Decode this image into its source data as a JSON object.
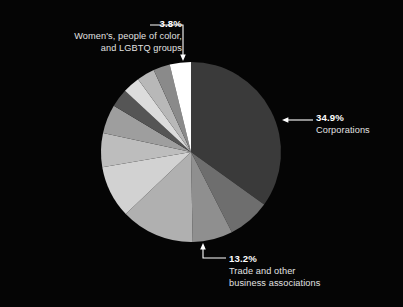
{
  "background": "#050505",
  "chart_data": {
    "type": "pie",
    "title": "",
    "subtitle": "",
    "xlabel": "",
    "ylabel": "",
    "legend_position": "callout-annotations",
    "grid": false,
    "center": {
      "x": 191,
      "y": 152
    },
    "radius": 90,
    "start_angle_deg": 0,
    "direction": "clockwise",
    "categories": [
      "Corporations",
      "Segment 2",
      "Segment 3",
      "Trade and other business associations",
      "Segment 5",
      "Segment 6",
      "Segment 7",
      "Segment 8",
      "Segment 9",
      "Segment 10",
      "Segment 11",
      "Women's, people of color, and LGBTQ groups"
    ],
    "values": [
      34.9,
      7.6,
      7.2,
      13.2,
      9.4,
      6.1,
      5.2,
      3.3,
      3.1,
      3.2,
      3.0,
      3.8
    ],
    "colors": [
      "#3a3a3a",
      "#6e6e6e",
      "#8f8f8f",
      "#b0b0b0",
      "#d2d2d2",
      "#bdbdbd",
      "#9e9e9e",
      "#555555",
      "#dcdcdc",
      "#b8b8b8",
      "#8a8a8a",
      "#ffffff"
    ],
    "annotations": [
      {
        "pct": "3.8%",
        "label": "Women's, people of color,\nand LGBTQ groups",
        "points_to": "Women's, people of color, and LGBTQ groups"
      },
      {
        "pct": "34.9%",
        "label": "Corporations",
        "points_to": "Corporations"
      },
      {
        "pct": "13.2%",
        "label": "Trade and other\nbusiness associations",
        "points_to": "Trade and other business associations"
      }
    ]
  },
  "labels": {
    "women": {
      "pct": "3.8%",
      "line1": "Women's, people of color,",
      "line2": "and LGBTQ groups"
    },
    "corporations": {
      "pct": "34.9%",
      "line1": "Corporations"
    },
    "trade": {
      "pct": "13.2%",
      "line1": "Trade and other",
      "line2": "business associations"
    }
  },
  "leader_color": "#ffffff"
}
